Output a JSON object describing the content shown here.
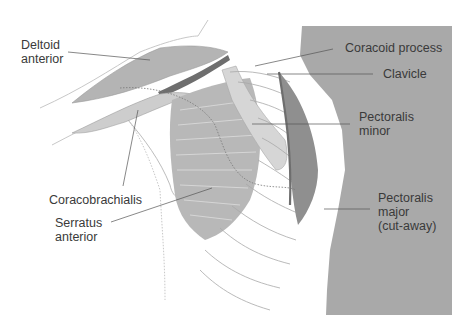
{
  "figure": {
    "colors": {
      "background": "#ffffff",
      "torso": "#a9a9a9",
      "muscle_mid": "#b8b8b8",
      "muscle_light": "#cfcfcf",
      "muscle_dark": "#8f8f8f",
      "clavicle_dark": "#6e6e6e",
      "outline": "#9a9a9a",
      "leader": "#555555",
      "text": "#3a3a3a"
    }
  },
  "labels": {
    "deltoid_anterior": "Deltoid\nanterior",
    "coracoid_process": "Coracoid process",
    "clavicle": "Clavicle",
    "pectoralis_minor": "Pectoralis\nminor",
    "coracobrachialis": "Coracobrachialis",
    "serratus_anterior": "Serratus\nanterior",
    "pectoralis_major": "Pectoralis\nmajor\n(cut-away)"
  }
}
